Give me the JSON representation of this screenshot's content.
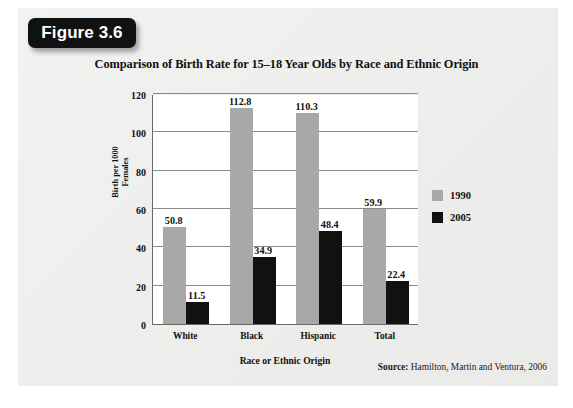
{
  "figure": {
    "badge_label": "Figure 3.6"
  },
  "source": {
    "label": "Source:",
    "text": " Hamilton, Martin and Ventura, 2006"
  },
  "chart_data": {
    "type": "bar",
    "title": "Comparison of Birth Rate for 15–18 Year Olds by Race and Ethnic Origin",
    "xlabel": "Race or Ethnic Origin",
    "ylabel": "Birth per 1000 Females",
    "ylabel_line1": "Birth per 1000",
    "ylabel_line2": "Females",
    "categories": [
      "White",
      "Black",
      "Hispanic",
      "Total"
    ],
    "series": [
      {
        "name": "1990",
        "color": "#a8a8a8",
        "values": [
          50.8,
          112.8,
          110.3,
          59.9
        ]
      },
      {
        "name": "2005",
        "color": "#111111",
        "values": [
          11.5,
          34.9,
          48.4,
          22.4
        ]
      }
    ],
    "ylim": [
      0,
      120
    ],
    "yticks": [
      0,
      20,
      40,
      60,
      80,
      100,
      120
    ],
    "ytick_labels": [
      "0",
      "20",
      "40",
      "60",
      "80",
      "100",
      "120"
    ],
    "grid": true,
    "legend_position": "right",
    "value_labels": true
  }
}
